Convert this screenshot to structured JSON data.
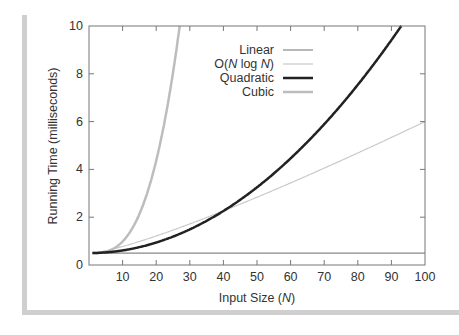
{
  "chart_data": {
    "type": "line",
    "title": "",
    "xlabel": "Input Size (N)",
    "ylabel": "Running Time (milliseconds)",
    "xlim": [
      0,
      100
    ],
    "ylim": [
      0,
      10
    ],
    "xticks": [
      10,
      20,
      30,
      40,
      50,
      60,
      70,
      80,
      90,
      100
    ],
    "yticks": [
      0,
      2,
      4,
      6,
      8,
      10
    ],
    "grid": false,
    "legend_position": "upper center",
    "series": [
      {
        "name": "Linear",
        "color": "#888888",
        "width": 1.2,
        "model": "constant",
        "x": [
          0,
          100
        ],
        "values": [
          0.5,
          0.5
        ]
      },
      {
        "name": "O(N log N)",
        "color": "#c8c8c8",
        "width": 1.2,
        "model": "0.5 + 0.00828*N*log2(N)",
        "x": [
          1,
          10,
          20,
          30,
          40,
          50,
          60,
          70,
          80,
          90,
          100
        ],
        "values": [
          0.5,
          0.78,
          1.22,
          1.71,
          2.26,
          2.84,
          3.42,
          4.03,
          4.65,
          5.27,
          6.0
        ]
      },
      {
        "name": "Quadratic",
        "color": "#222222",
        "width": 2.5,
        "model": "0.5 + 0.0011*N^2",
        "x": [
          1,
          10,
          20,
          30,
          40,
          50,
          60,
          70,
          80,
          90,
          93
        ],
        "values": [
          0.5,
          0.61,
          0.94,
          1.49,
          2.26,
          3.25,
          4.46,
          5.89,
          7.54,
          9.41,
          10.0
        ]
      },
      {
        "name": "Cubic",
        "color": "#bdbdbd",
        "width": 2.5,
        "model": "0.5 + 0.000483*N^3",
        "x": [
          1,
          5,
          10,
          15,
          20,
          25,
          27
        ],
        "values": [
          0.5,
          0.56,
          0.98,
          2.13,
          4.36,
          8.05,
          10.0
        ]
      }
    ]
  },
  "labels": {
    "xlabel_prefix": "Input Size (",
    "xlabel_var": "N",
    "xlabel_suffix": ")",
    "ylabel": "Running Time (milliseconds)",
    "legend": [
      "Linear",
      "O(N log N)",
      "Quadratic",
      "Cubic"
    ]
  }
}
